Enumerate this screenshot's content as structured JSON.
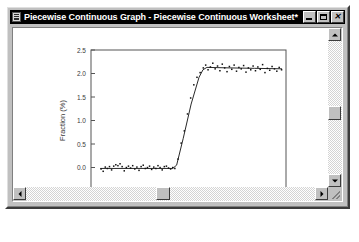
{
  "window": {
    "title": "Piecewise Continuous Graph - Piecewise Continuous Worksheet*",
    "icon": "graph-document-icon",
    "buttons": {
      "minimize": "_",
      "maximize": "□",
      "close": "✕"
    }
  },
  "scrollbars": {
    "vertical": {
      "up": "▲",
      "down": "▼"
    },
    "horizontal": {
      "left": "◀",
      "right": "▶"
    }
  },
  "chart_data": {
    "type": "scatter",
    "title": "",
    "xlabel": "Time (sec)",
    "ylabel": "Fraction (%)",
    "xlim": [
      -2,
      72
    ],
    "ylim": [
      -0.5,
      2.5
    ],
    "xticks": [
      0,
      20,
      40,
      60
    ],
    "yticks": [
      -0.5,
      0.0,
      0.5,
      1.0,
      1.5,
      2.0,
      2.5
    ],
    "xticklabels": [
      "0",
      "20",
      "40",
      "60"
    ],
    "yticklabels": [
      "-0.5",
      "0.0",
      "0.5",
      "1.0",
      "1.5",
      "2.0",
      "2.5"
    ],
    "grid": false,
    "legend": false,
    "marker_color": "#111111",
    "line_color": "#111111",
    "series": [
      {
        "name": "fit",
        "kind": "line",
        "x": [
          1.5,
          29.0,
          30.5,
          33.0,
          36.0,
          39.0,
          40.5,
          42.0,
          50.0,
          60.0,
          70.5
        ],
        "y": [
          -0.02,
          -0.02,
          0.05,
          0.62,
          1.35,
          1.92,
          2.08,
          2.13,
          2.12,
          2.11,
          2.1
        ]
      },
      {
        "name": "data",
        "kind": "markers",
        "x": [
          1.8,
          2.6,
          3.4,
          4.2,
          5.0,
          5.8,
          6.6,
          7.4,
          8.2,
          9.0,
          9.8,
          10.6,
          11.4,
          12.2,
          13.0,
          13.8,
          14.6,
          15.4,
          16.2,
          17.0,
          17.8,
          18.6,
          19.4,
          20.2,
          21.0,
          21.8,
          22.6,
          23.4,
          24.2,
          25.0,
          25.8,
          26.6,
          27.4,
          28.2,
          29.0,
          29.8,
          31.0,
          32.2,
          33.4,
          34.6,
          35.8,
          37.0,
          38.2,
          39.4,
          40.6,
          41.5,
          42.4,
          43.3,
          44.2,
          45.1,
          46.0,
          46.9,
          47.8,
          48.7,
          49.6,
          50.5,
          51.4,
          52.3,
          53.2,
          54.1,
          55.0,
          55.9,
          56.8,
          57.7,
          58.6,
          59.5,
          60.4,
          61.3,
          62.2,
          63.1,
          64.0,
          64.9,
          65.8,
          66.7,
          67.6,
          68.5,
          69.4,
          70.3
        ],
        "y": [
          -0.03,
          -0.08,
          0.01,
          -0.02,
          0.02,
          -0.05,
          0.03,
          0.06,
          0.04,
          0.08,
          0.02,
          -0.07,
          0.0,
          0.03,
          -0.01,
          0.04,
          -0.03,
          0.01,
          -0.06,
          0.02,
          0.05,
          -0.02,
          0.0,
          0.03,
          -0.04,
          0.01,
          -0.02,
          0.04,
          0.0,
          -0.05,
          0.02,
          0.03,
          -0.01,
          -0.03,
          0.0,
          -0.02,
          0.18,
          0.52,
          0.78,
          1.14,
          1.48,
          1.76,
          1.92,
          2.02,
          2.12,
          2.18,
          2.08,
          2.14,
          2.22,
          2.1,
          2.16,
          2.06,
          2.2,
          2.12,
          2.04,
          2.15,
          2.09,
          2.18,
          2.05,
          2.13,
          2.1,
          2.17,
          2.03,
          2.12,
          2.08,
          2.16,
          2.06,
          2.14,
          2.09,
          2.19,
          2.02,
          2.11,
          2.07,
          2.15,
          2.1,
          2.05,
          2.13,
          2.08
        ]
      }
    ]
  }
}
